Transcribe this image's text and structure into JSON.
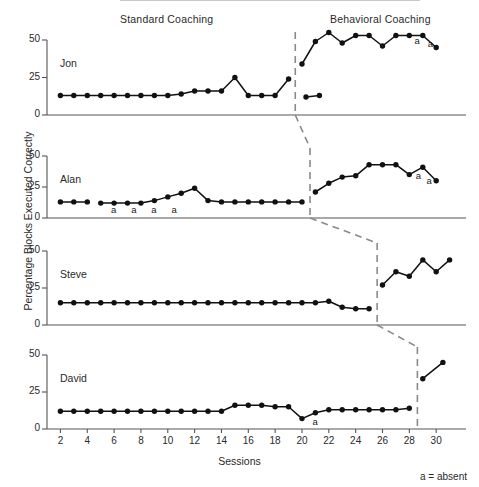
{
  "figure": {
    "y_axis_title": "Percentage Blocks Executed Correctly",
    "x_axis_title": "Sessions",
    "footnote": "a = absent",
    "phase_labels": {
      "standard": "Standard Coaching",
      "behavioral": "Behavioral Coaching"
    },
    "absent_marker": "a",
    "colors": {
      "line": "#111111",
      "marker": "#111111",
      "axis": "#555555",
      "phase_line": "#8a8a8a",
      "text": "#2a2a2a",
      "background": "#ffffff"
    }
  },
  "chart_data": {
    "type": "line",
    "title": "",
    "subtitle": "",
    "xlabel": "Sessions",
    "ylabel": "Percentage Blocks Executed Correctly",
    "xlim": [
      1,
      31
    ],
    "ylim": [
      0,
      55
    ],
    "yticks": [
      0,
      25,
      50
    ],
    "ytick_labels": [
      "0",
      "25",
      "50"
    ],
    "xticks": [
      2,
      4,
      6,
      8,
      10,
      12,
      14,
      16,
      18,
      20,
      22,
      24,
      26,
      28,
      30
    ],
    "xtick_labels": [
      "2",
      "4",
      "6",
      "8",
      "10",
      "12",
      "14",
      "16",
      "18",
      "20",
      "22",
      "24",
      "26",
      "28",
      "30"
    ],
    "grid": false,
    "legend": "none",
    "design": "multiple-baseline-across-subjects",
    "phases": [
      "Standard Coaching",
      "Behavioral Coaching"
    ],
    "panels": [
      {
        "name": "Jon",
        "phase_change_session": 19.5,
        "baseline": {
          "x": [
            2,
            3,
            4,
            5,
            6,
            7,
            8,
            9,
            10,
            11,
            12,
            13,
            14,
            15,
            16,
            17,
            18,
            19
          ],
          "y": [
            13,
            13,
            13,
            13,
            13,
            13,
            13,
            13,
            13,
            14,
            16,
            16,
            16,
            25,
            13,
            13,
            13,
            24
          ]
        },
        "treatment": {
          "x": [
            20,
            21,
            22,
            23,
            24,
            25,
            26,
            27,
            28,
            29,
            30
          ],
          "y": [
            34,
            49,
            55,
            48,
            53,
            53,
            46,
            53,
            53,
            53,
            45
          ]
        },
        "tail_extra": {
          "x": [
            20.3,
            21.3
          ],
          "y": [
            12,
            13
          ]
        },
        "absent": [
          {
            "x": 28.6,
            "y": 49,
            "label": "a"
          },
          {
            "x": 29.6,
            "y": 47,
            "label": "a"
          }
        ]
      },
      {
        "name": "Alan",
        "phase_change_session": 20.6,
        "baseline": {
          "x": [
            2,
            3,
            4,
            5,
            6,
            7,
            8,
            9,
            10,
            11,
            12,
            13,
            14,
            15,
            16,
            17,
            18,
            19,
            20
          ],
          "y": [
            13,
            13,
            13,
            12,
            12,
            12,
            12,
            14,
            17,
            20,
            24,
            14,
            13,
            13,
            13,
            13,
            13,
            13,
            13
          ]
        },
        "treatment": {
          "x": [
            21,
            22,
            23,
            24,
            25,
            26,
            27,
            28,
            29,
            30
          ],
          "y": [
            21,
            28,
            33,
            34,
            43,
            43,
            43,
            35,
            41,
            30
          ]
        },
        "absent": [
          {
            "x": 6,
            "y": 6,
            "label": "a"
          },
          {
            "x": 7.5,
            "y": 6,
            "label": "a"
          },
          {
            "x": 9,
            "y": 6,
            "label": "a"
          },
          {
            "x": 10.5,
            "y": 6,
            "label": "a"
          },
          {
            "x": 28.7,
            "y": 33,
            "label": "a"
          },
          {
            "x": 29.5,
            "y": 29,
            "label": "a"
          }
        ],
        "baseline_gap": {
          "after_index": 2,
          "resume_index": 3
        }
      },
      {
        "name": "Steve",
        "phase_change_session": 25.6,
        "baseline": {
          "x": [
            2,
            3,
            4,
            5,
            6,
            7,
            8,
            9,
            10,
            11,
            12,
            13,
            14,
            15,
            16,
            17,
            18,
            19,
            20,
            21,
            22,
            23,
            24,
            25
          ],
          "y": [
            15,
            15,
            15,
            15,
            15,
            15,
            15,
            15,
            15,
            15,
            15,
            15,
            15,
            15,
            15,
            15,
            15,
            15,
            15,
            15,
            16,
            12,
            11,
            11
          ]
        },
        "treatment": {
          "x": [
            26,
            27,
            28,
            29,
            30,
            31
          ],
          "y": [
            27,
            36,
            33,
            44,
            36,
            44
          ]
        },
        "absent": []
      },
      {
        "name": "David",
        "phase_change_session": 28.6,
        "baseline": {
          "x": [
            2,
            3,
            4,
            5,
            6,
            7,
            8,
            9,
            10,
            11,
            12,
            13,
            14,
            15,
            16,
            17,
            18,
            19,
            20,
            21,
            22,
            23,
            24,
            25,
            26,
            27,
            28
          ],
          "y": [
            12,
            12,
            12,
            12,
            12,
            12,
            12,
            12,
            12,
            12,
            12,
            12,
            12,
            16,
            16,
            16,
            15,
            15,
            7,
            11,
            13,
            13,
            13,
            13,
            13,
            13,
            14
          ]
        },
        "treatment": {
          "x": [
            29,
            30.5
          ],
          "y": [
            34,
            45
          ]
        },
        "absent": [
          {
            "x": 21,
            "y": 4,
            "label": "a"
          }
        ]
      }
    ],
    "connector_lines": [
      {
        "from_panel": 0,
        "to_panel": 1
      },
      {
        "from_panel": 1,
        "to_panel": 2
      },
      {
        "from_panel": 2,
        "to_panel": 3
      }
    ]
  }
}
